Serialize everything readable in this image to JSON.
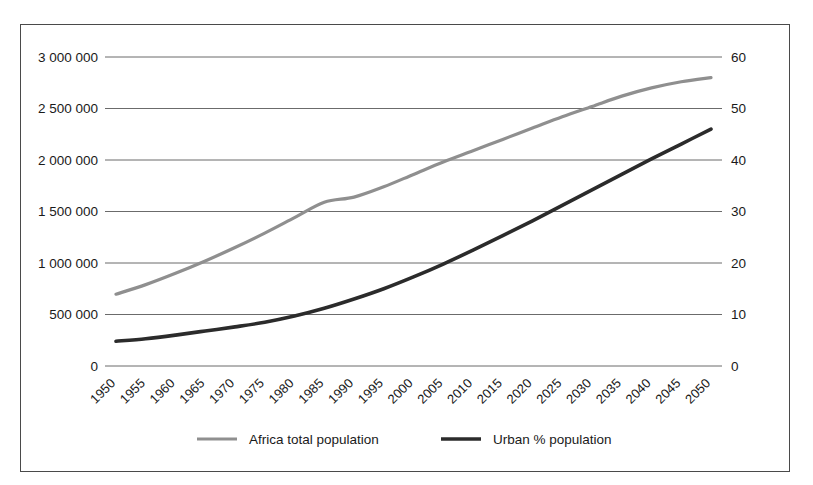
{
  "chart_data": {
    "type": "line",
    "title": "",
    "xlabel": "",
    "ylabel": "",
    "grid": true,
    "legend_position": "bottom",
    "x": [
      1950,
      1955,
      1960,
      1965,
      1970,
      1975,
      1980,
      1985,
      1990,
      1995,
      2000,
      2005,
      2010,
      2015,
      2020,
      2025,
      2030,
      2035,
      2040,
      2045,
      2050
    ],
    "categories": [
      "1950",
      "1955",
      "1960",
      "1965",
      "1970",
      "1975",
      "1980",
      "1985",
      "1990",
      "1995",
      "2000",
      "2005",
      "2010",
      "2015",
      "2020",
      "2025",
      "2030",
      "2035",
      "2040",
      "2045",
      "2050"
    ],
    "axes": {
      "left": {
        "label": "",
        "ylim": [
          0,
          3000000
        ],
        "ticks": [
          0,
          500000,
          1000000,
          1500000,
          2000000,
          2500000,
          3000000
        ],
        "tick_labels": [
          "0",
          "500 000",
          "1 000 000",
          "1 500 000",
          "2 000 000",
          "2 500 000",
          "3 000 000"
        ]
      },
      "right": {
        "label": "",
        "ylim": [
          0,
          60
        ],
        "ticks": [
          0,
          10,
          20,
          30,
          40,
          50,
          60
        ],
        "tick_labels": [
          "0",
          "10",
          "20",
          "30",
          "40",
          "50",
          "60"
        ]
      },
      "x": {
        "ticks": [
          1950,
          1955,
          1960,
          1965,
          1970,
          1975,
          1980,
          1985,
          1990,
          1995,
          2000,
          2005,
          2010,
          2015,
          2020,
          2025,
          2030,
          2035,
          2040,
          2045,
          2050
        ],
        "rotation": 45
      }
    },
    "series": [
      {
        "name": "Africa total population",
        "axis": "left",
        "color": "#8f8f8f",
        "width": 3.2,
        "values": [
          697000,
          790000,
          900000,
          1020000,
          1150000,
          1290000,
          1440000,
          1590000,
          1640000,
          1740000,
          1860000,
          1980000,
          2090000,
          2200000,
          2310000,
          2420000,
          2520000,
          2620000,
          2700000,
          2760000,
          2800000
        ]
      },
      {
        "name": "Urban % population",
        "axis": "right",
        "color": "#2b2b2b",
        "width": 3.6,
        "values": [
          4.8,
          5.3,
          6.0,
          6.8,
          7.6,
          8.5,
          9.7,
          11.2,
          13.0,
          15.0,
          17.3,
          19.8,
          22.5,
          25.3,
          28.2,
          31.2,
          34.2,
          37.2,
          40.2,
          43.1,
          46.0
        ]
      }
    ],
    "legend": [
      {
        "label": "Africa total population",
        "color": "#8f8f8f",
        "width": 3.2
      },
      {
        "label": "Urban % population",
        "color": "#2b2b2b",
        "width": 3.6
      }
    ]
  },
  "style": {
    "frame_color": "#4a4a4a",
    "grid_color": "#5a5a5a",
    "text_color": "#1a1a1a",
    "background": "#ffffff"
  }
}
